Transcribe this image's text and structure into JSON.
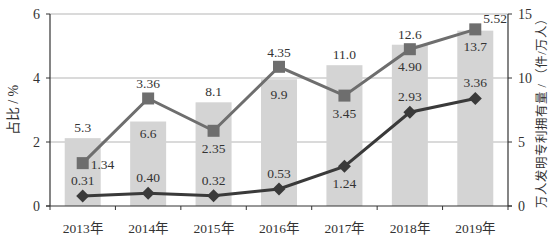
{
  "chart_data": {
    "type": "bar+line",
    "title": "",
    "categories": [
      "2013年",
      "2014年",
      "2015年",
      "2016年",
      "2017年",
      "2018年",
      "2019年"
    ],
    "left_axis": {
      "label": "占比 / %",
      "ylim": [
        0,
        6
      ],
      "ticks": [
        0,
        2,
        4,
        6
      ]
    },
    "right_axis": {
      "label": "万人发明专利拥有量 / （件/万人）",
      "ylim": [
        0,
        15
      ],
      "ticks": [
        0,
        5,
        10,
        15
      ]
    },
    "grid": true,
    "series": [
      {
        "name": "万人发明专利拥有量",
        "type": "bar",
        "axis": "right",
        "color": "#d4d4d4",
        "values": [
          5.3,
          6.6,
          8.1,
          9.9,
          11.0,
          12.6,
          13.7
        ],
        "labels": [
          "5.3",
          "6.6",
          "8.1",
          "9.9",
          "11.0",
          "12.6",
          "13.7"
        ]
      },
      {
        "name": "占比（方形）",
        "type": "line",
        "marker": "square",
        "axis": "left",
        "color": "#6e6e6e",
        "values": [
          1.34,
          3.36,
          2.35,
          4.35,
          3.45,
          4.9,
          5.52
        ],
        "labels": [
          "1.34",
          "3.36",
          "2.35",
          "4.35",
          "3.45",
          "4.90",
          "5.52"
        ]
      },
      {
        "name": "占比（菱形）",
        "type": "line",
        "marker": "diamond",
        "axis": "left",
        "color": "#3a3a3a",
        "values": [
          0.31,
          0.4,
          0.32,
          0.53,
          1.24,
          2.93,
          3.36
        ],
        "labels": [
          "0.31",
          "0.40",
          "0.32",
          "0.53",
          "1.24",
          "2.93",
          "3.36"
        ]
      }
    ]
  }
}
